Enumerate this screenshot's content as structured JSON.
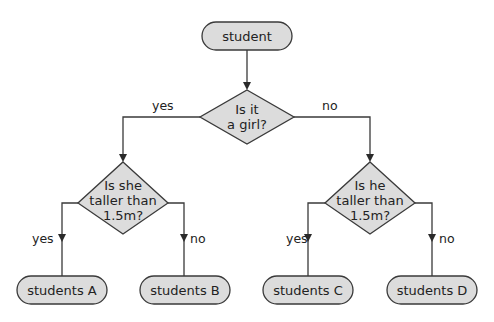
{
  "diagram": {
    "type": "decision-tree flowchart",
    "root": {
      "label": "student"
    },
    "decision_main": {
      "line1": "Is it",
      "line2": "a girl?"
    },
    "branch_main": {
      "yes": "yes",
      "no": "no"
    },
    "decision_left": {
      "line1": "Is she",
      "line2": "taller than",
      "line3": "1.5m?"
    },
    "branch_left": {
      "yes": "yes",
      "no": "no"
    },
    "decision_right": {
      "line1": "Is he",
      "line2": "taller than",
      "line3": "1.5m?"
    },
    "branch_right": {
      "yes": "yes",
      "no": "no"
    },
    "leaves": [
      {
        "label": "students A"
      },
      {
        "label": "students B"
      },
      {
        "label": "students C"
      },
      {
        "label": "students D"
      }
    ],
    "colors": {
      "node_fill": "#dcdcdc",
      "stroke": "#3a3a3a"
    }
  }
}
